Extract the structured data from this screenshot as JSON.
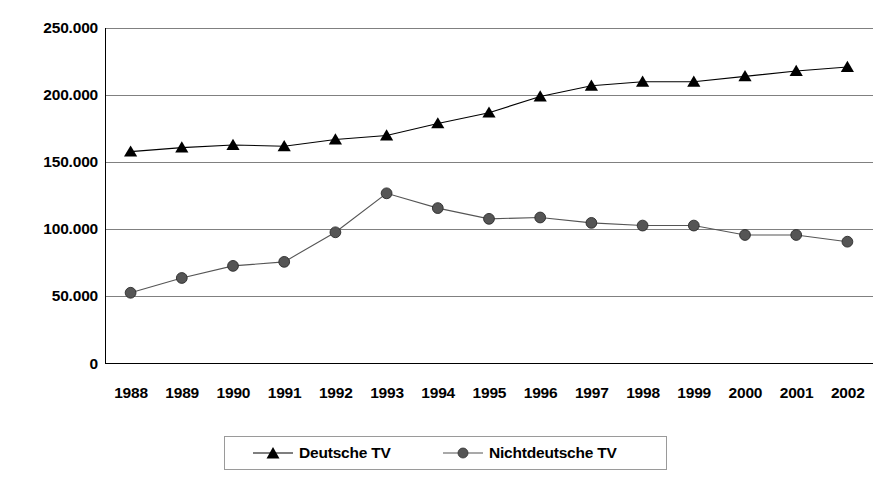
{
  "chart_data": {
    "type": "line",
    "title": "",
    "subtitle": "",
    "xlabel": "",
    "ylabel": "",
    "categories": [
      "1988",
      "1989",
      "1990",
      "1991",
      "1992",
      "1993",
      "1994",
      "1995",
      "1996",
      "1997",
      "1998",
      "1999",
      "2000",
      "2001",
      "2002"
    ],
    "series": [
      {
        "name": "Deutsche TV",
        "marker": "triangle",
        "color": "#000000",
        "values": [
          158000,
          161000,
          163000,
          162000,
          167000,
          170000,
          179000,
          187000,
          199000,
          207000,
          210000,
          210000,
          214000,
          218000,
          221000
        ]
      },
      {
        "name": "Nichtdeutsche TV",
        "marker": "circle",
        "color": "#555555",
        "values": [
          53000,
          64000,
          73000,
          76000,
          98000,
          127000,
          116000,
          108000,
          109000,
          105000,
          103000,
          103000,
          96000,
          96000,
          91000
        ]
      }
    ],
    "ylim": [
      0,
      250000
    ],
    "ytick_values": [
      0,
      50000,
      100000,
      150000,
      200000,
      250000
    ],
    "ytick_labels": [
      "0",
      "50.000",
      "100.000",
      "150.000",
      "200.000",
      "250.000"
    ],
    "grid": true,
    "grid_axis": "y",
    "legend_position": "bottom",
    "number_format": "german-dot-thousands"
  },
  "legend": {
    "entries": [
      {
        "label": "Deutsche TV",
        "marker": "triangle-marker"
      },
      {
        "label": "Nichtdeutsche TV",
        "marker": "circle-marker"
      }
    ]
  },
  "colors": {
    "series_deutsche": "#000000",
    "series_nichtdeutsche": "#555555",
    "gridline": "#808080",
    "axis": "#000000",
    "legend_border": "#9a9a9a",
    "background": "#ffffff"
  }
}
